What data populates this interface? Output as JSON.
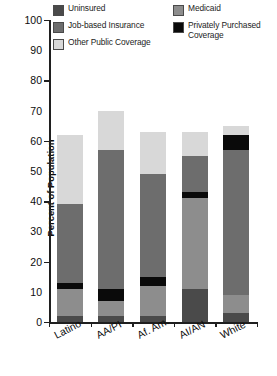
{
  "chart_data": {
    "type": "bar",
    "subtype": "stacked-bar",
    "title": "",
    "xlabel": "",
    "ylabel": "Percent of Population",
    "ylim": [
      0,
      100
    ],
    "ytick_step": 10,
    "ytick_labels": [
      "100",
      "90",
      "80",
      "70",
      "60",
      "50",
      "40",
      "30",
      "20",
      "10",
      "0"
    ],
    "major_tick_values": [
      100,
      80,
      60,
      40,
      20,
      0
    ],
    "grid": false,
    "legend_position": "top",
    "categories": [
      "Latino",
      "AA/PI",
      "Af. Am.",
      "AI/AN",
      "White"
    ],
    "stack_order_bottom_to_top": [
      "Uninsured",
      "Medicaid",
      "Privately Purchased Coverage",
      "Job-based Insurance",
      "Other Public Coverage"
    ],
    "series": [
      {
        "name": "Uninsured",
        "color": "#4a4a4a",
        "values": [
          2,
          2,
          2,
          11,
          3
        ]
      },
      {
        "name": "Medicaid",
        "color": "#8d8d8d",
        "values": [
          9,
          5,
          10,
          30,
          6
        ]
      },
      {
        "name": "Privately Purchased Coverage",
        "color": "#0a0a0a",
        "values": [
          2,
          4,
          3,
          2,
          0
        ]
      },
      {
        "name": "Job-based Insurance",
        "color": "#6d6d6d",
        "values": [
          26,
          46,
          34,
          12,
          48
        ]
      },
      {
        "name": "Other Public Coverage",
        "color": "#d8d8d8",
        "values": [
          23,
          13,
          14,
          8,
          3
        ]
      }
    ],
    "totals": [
      62,
      70,
      63,
      63,
      65
    ],
    "bar_stacks": [
      {
        "category": "Latino",
        "total": 62,
        "segments": [
          {
            "name": "Uninsured",
            "value": 2,
            "color": "#4a4a4a"
          },
          {
            "name": "Medicaid",
            "value": 9,
            "color": "#8d8d8d"
          },
          {
            "name": "Privately Purchased Coverage",
            "value": 2,
            "color": "#0a0a0a"
          },
          {
            "name": "Job-based Insurance",
            "value": 26,
            "color": "#6d6d6d"
          },
          {
            "name": "Other Public Coverage",
            "value": 23,
            "color": "#d8d8d8"
          }
        ]
      },
      {
        "category": "AA/PI",
        "total": 70,
        "segments": [
          {
            "name": "Uninsured",
            "value": 2,
            "color": "#4a4a4a"
          },
          {
            "name": "Medicaid",
            "value": 5,
            "color": "#8d8d8d"
          },
          {
            "name": "Privately Purchased Coverage",
            "value": 4,
            "color": "#0a0a0a"
          },
          {
            "name": "Job-based Insurance",
            "value": 46,
            "color": "#6d6d6d"
          },
          {
            "name": "Other Public Coverage",
            "value": 13,
            "color": "#d8d8d8"
          }
        ]
      },
      {
        "category": "Af. Am.",
        "total": 63,
        "segments": [
          {
            "name": "Uninsured",
            "value": 2,
            "color": "#4a4a4a"
          },
          {
            "name": "Medicaid",
            "value": 10,
            "color": "#8d8d8d"
          },
          {
            "name": "Privately Purchased Coverage",
            "value": 3,
            "color": "#0a0a0a"
          },
          {
            "name": "Job-based Insurance",
            "value": 34,
            "color": "#6d6d6d"
          },
          {
            "name": "Other Public Coverage",
            "value": 14,
            "color": "#d8d8d8"
          }
        ]
      },
      {
        "category": "AI/AN",
        "total": 63,
        "segments": [
          {
            "name": "Uninsured",
            "value": 11,
            "color": "#4a4a4a"
          },
          {
            "name": "Medicaid",
            "value": 30,
            "color": "#8d8d8d"
          },
          {
            "name": "Privately Purchased Coverage",
            "value": 2,
            "color": "#0a0a0a"
          },
          {
            "name": "Job-based Insurance",
            "value": 12,
            "color": "#6d6d6d"
          },
          {
            "name": "Other Public Coverage",
            "value": 8,
            "color": "#d8d8d8"
          }
        ]
      },
      {
        "category": "White",
        "total": 65,
        "segments": [
          {
            "name": "Uninsured",
            "value": 3,
            "color": "#4a4a4a"
          },
          {
            "name": "Medicaid",
            "value": 6,
            "color": "#8d8d8d"
          },
          {
            "name": "Job-based Insurance",
            "value": 48,
            "color": "#6d6d6d"
          },
          {
            "name": "Privately Purchased Coverage",
            "value": 5,
            "color": "#0a0a0a"
          },
          {
            "name": "Other Public Coverage",
            "value": 3,
            "color": "#d8d8d8"
          }
        ]
      }
    ]
  },
  "legend": {
    "entries": [
      {
        "label": "Uninsured",
        "color": "#4a4a4a"
      },
      {
        "label": "Job-based Insurance",
        "color": "#6d6d6d"
      },
      {
        "label": "Other Public Coverage",
        "color": "#d8d8d8"
      },
      {
        "label": "Medicaid",
        "color": "#8d8d8d"
      },
      {
        "label": "Privately Purchased\nCoverage",
        "color": "#0a0a0a"
      }
    ]
  },
  "axis": {
    "y_title": "Percent of Population"
  }
}
